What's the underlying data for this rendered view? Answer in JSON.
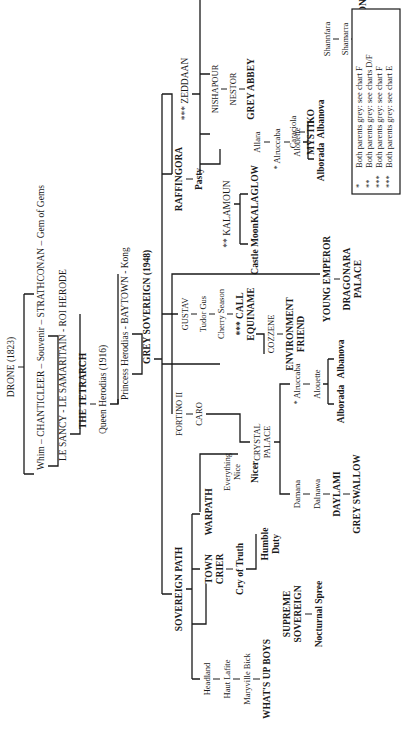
{
  "diagram": {
    "orientation": "rotated 90 degrees counter-clockwise",
    "ancestry": {
      "root": "DRONE (1823)",
      "line1": "Whim – CHANTICLEER – Souvenir – STRATHCONAN – Gem of Gems",
      "line2": "LE SANCY - LE SAMARITAIN - ROI HERODE",
      "line3": "THE TETRARCH",
      "line4": "Queen Herodias (1916)",
      "line5": "Princess Herodias - BAYTOWN - Kong",
      "line6": "GREY SOVEREIGN (1948)"
    },
    "branches": {
      "zeddaan": {
        "name": "*** ZEDDAAN",
        "nishapour": "NISHAPOUR",
        "nestor": "NESTOR",
        "grey_abbey": "GREY ABBEY",
        "shannfara": "Shannfara",
        "shamarra": "Shamarra",
        "proclamation": "PROCLAMATION",
        "caraciola": "Caraciola",
        "mystiko": "MYSTIKO"
      },
      "raffingora": {
        "name": "RAFFINGORA",
        "pasty": "Pasty",
        "kalamoun": "** KALAMOUN",
        "castle_moon": "Castle Moon",
        "kalaglow": "KALAGLOW",
        "allara": "Allara",
        "alruccaba": "* Alruccaba",
        "alouette": "Alouette",
        "alborada": "Alborada",
        "albanova": "Albanova"
      },
      "gustav": {
        "name": "GUSTAV",
        "tudor_gus": "Tudor Gus",
        "cherry_season": "Cherry Season",
        "call_equiname_1": "*** CALL",
        "call_equiname_2": "EQUINAME"
      },
      "cozzene": {
        "name": "COZZENE",
        "env_friend_1": "ENVIRONMENT",
        "env_friend_2": "FRIEND"
      },
      "young_emperor": {
        "name": "YOUNG EMPEROR",
        "dragonara_1": "DRAGONARA",
        "dragonara_2": "PALACE"
      },
      "fortino": {
        "name": "FORTINO II",
        "caro": "CARO",
        "crystal_palace_1": "CRYSTAL",
        "crystal_palace_2": "PALACE",
        "alruccaba": "* Alruccaba",
        "alouette": "Alouette",
        "alborada": "Alborada",
        "albanova": "Albanova",
        "damana": "Damana",
        "dalnawa": "Dalnawa",
        "daylami": "DAYLAMI",
        "grey_swallow": "GREY SWALLOW"
      },
      "sovereign_path": {
        "name": "SOVEREIGN PATH",
        "warpath": "WARPATH",
        "everything_nice_1": "Everything",
        "everything_nice_2": "Nice",
        "nicer": "Nicer",
        "town_crier_1": "TOWN",
        "town_crier_2": "CRIER",
        "cry_of_truth": "Cry of Truth",
        "humble_duty_1": "Humble",
        "humble_duty_2": "Duty",
        "headland": "Headland",
        "haut_lafite": "Haut Lafite",
        "maryville_bick": "Maryville Bick",
        "whats_up_boys": "WHAT'S UP BOYS",
        "supreme_sovereign_1": "SUPREME",
        "supreme_sovereign_2": "SOVEREIGN",
        "nocturnal_spree": "Nocturnal Spree"
      }
    },
    "legend": {
      "items": [
        {
          "marker": "*",
          "text": "Both parents grey: see chart F"
        },
        {
          "marker": "**",
          "text": "Both parents grey: see charts D/F"
        },
        {
          "marker": "***",
          "text": "Both parents grey: see chart F"
        },
        {
          "marker": "***",
          "text": "Both parents grey: see chart E"
        }
      ]
    }
  }
}
